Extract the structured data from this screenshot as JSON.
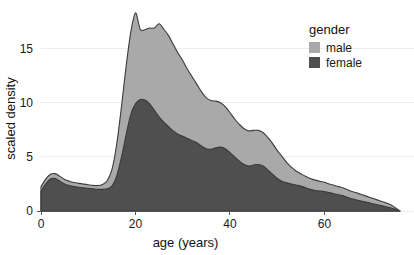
{
  "chart_data": {
    "type": "area",
    "title": "",
    "xlabel": "age (years)",
    "ylabel": "scaled density",
    "xlim": [
      0,
      76
    ],
    "ylim": [
      0,
      18.2
    ],
    "xticks": [
      0,
      20,
      40,
      60
    ],
    "yticks": [
      0,
      5,
      10,
      15
    ],
    "grid": true,
    "stacked": true,
    "legend": {
      "title": "gender",
      "position": "top-right",
      "entries": [
        {
          "label": "male",
          "color": "#a9a9a9"
        },
        {
          "label": "female",
          "color": "#4f4f4f"
        }
      ]
    },
    "x": [
      0,
      1,
      2,
      3,
      4,
      5,
      6,
      7,
      8,
      9,
      10,
      11,
      12,
      13,
      14,
      15,
      16,
      17,
      18,
      19,
      20,
      21,
      22,
      23,
      24,
      25,
      26,
      27,
      28,
      29,
      30,
      31,
      32,
      33,
      34,
      35,
      36,
      37,
      38,
      39,
      40,
      41,
      42,
      43,
      44,
      45,
      46,
      47,
      48,
      49,
      50,
      51,
      52,
      53,
      54,
      55,
      56,
      57,
      58,
      59,
      60,
      61,
      62,
      63,
      64,
      65,
      66,
      67,
      68,
      69,
      70,
      71,
      72,
      73,
      74,
      75,
      76
    ],
    "series": [
      {
        "name": "female",
        "color": "#4f4f4f",
        "values": [
          1.8,
          2.5,
          2.95,
          3.0,
          2.75,
          2.5,
          2.35,
          2.25,
          2.2,
          2.15,
          2.1,
          2.05,
          2.0,
          2.0,
          2.05,
          2.3,
          3.2,
          4.9,
          7.0,
          8.9,
          9.9,
          10.3,
          10.25,
          9.9,
          9.3,
          8.7,
          8.2,
          7.8,
          7.4,
          7.1,
          6.9,
          6.7,
          6.5,
          6.3,
          6.0,
          5.75,
          5.7,
          5.85,
          5.9,
          5.75,
          5.4,
          5.0,
          4.6,
          4.3,
          4.15,
          4.25,
          4.3,
          4.15,
          3.8,
          3.4,
          3.0,
          2.75,
          2.6,
          2.5,
          2.4,
          2.3,
          2.15,
          2.0,
          1.9,
          1.85,
          1.8,
          1.7,
          1.6,
          1.5,
          1.4,
          1.25,
          1.1,
          1.0,
          0.9,
          0.8,
          0.7,
          0.6,
          0.5,
          0.4,
          0.3,
          0.15,
          0.0
        ]
      },
      {
        "name": "male",
        "color": "#a9a9a9",
        "values": [
          0.45,
          0.45,
          0.45,
          0.45,
          0.45,
          0.42,
          0.4,
          0.38,
          0.35,
          0.33,
          0.32,
          0.32,
          0.35,
          0.45,
          0.75,
          1.5,
          2.9,
          4.6,
          6.3,
          7.6,
          8.4,
          6.5,
          6.5,
          7.0,
          7.6,
          8.6,
          8.6,
          8.4,
          8.0,
          7.5,
          7.0,
          6.4,
          5.9,
          5.4,
          5.0,
          4.7,
          4.5,
          4.3,
          4.1,
          3.9,
          3.7,
          3.5,
          3.4,
          3.3,
          3.25,
          3.2,
          3.15,
          3.1,
          3.0,
          2.85,
          2.6,
          2.3,
          1.9,
          1.55,
          1.3,
          1.15,
          1.05,
          1.0,
          0.95,
          0.9,
          0.85,
          0.8,
          0.78,
          0.75,
          0.72,
          0.7,
          0.68,
          0.65,
          0.6,
          0.55,
          0.5,
          0.45,
          0.4,
          0.35,
          0.28,
          0.15,
          0.0
        ]
      }
    ],
    "total_peak": {
      "x": 25,
      "y": 17.3
    },
    "female_peak": {
      "x": 21,
      "y": 10.3
    }
  },
  "style": {
    "background": "#ffffff",
    "grid_color": "#ededed",
    "axis_color": "#555555",
    "text_color": "#1a1a1a",
    "male_fill": "#a9a9a9",
    "female_fill": "#4f4f4f",
    "outline_color": "#3a3a3a"
  }
}
